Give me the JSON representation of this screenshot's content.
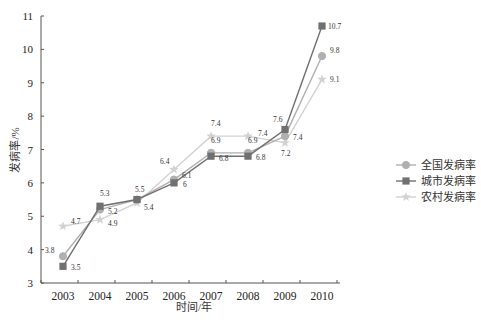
{
  "chart_data": {
    "type": "line",
    "title": "",
    "xlabel": "时间/年",
    "ylabel": "发病率/%",
    "categories": [
      "2003",
      "2004",
      "2005",
      "2006",
      "2007",
      "2008",
      "2009",
      "2010"
    ],
    "ylim": [
      3,
      11
    ],
    "yticks": [
      3,
      4,
      5,
      6,
      7,
      8,
      9,
      10,
      11
    ],
    "grid": false,
    "legend_position": "right",
    "series": [
      {
        "name": "全国发病率",
        "marker": "circle",
        "color": "#b0b0b0",
        "values": [
          3.8,
          5.2,
          5.5,
          6.1,
          6.9,
          6.9,
          7.4,
          9.8
        ]
      },
      {
        "name": "城市发病率",
        "marker": "square",
        "color": "#707070",
        "values": [
          3.5,
          5.3,
          5.5,
          6.0,
          6.8,
          6.8,
          7.6,
          10.7
        ]
      },
      {
        "name": "农村发病率",
        "marker": "star",
        "color": "#d2d2d2",
        "values": [
          4.7,
          4.9,
          5.4,
          6.4,
          7.4,
          7.4,
          7.2,
          9.1
        ]
      }
    ],
    "data_labels": [
      {
        "series": 0,
        "labels": [
          "3.8",
          "5.2",
          "",
          "6.1",
          "6.9",
          "6.9",
          "7.4",
          "9.8"
        ]
      },
      {
        "series": 1,
        "labels": [
          "3.5",
          "5.3",
          "5.5",
          "6",
          "6.8",
          "6.8",
          "7.6",
          "10.7"
        ]
      },
      {
        "series": 2,
        "labels": [
          "4.7",
          "4.9",
          "5.4",
          "6.4",
          "7.4",
          "7.4",
          "7.2",
          "9.1"
        ]
      }
    ]
  },
  "legend": {
    "items": [
      "全国发病率",
      "城市发病率",
      "农村发病率"
    ]
  }
}
